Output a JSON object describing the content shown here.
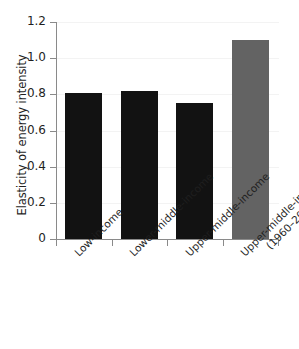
{
  "chart_data": {
    "type": "bar",
    "title": "",
    "xlabel": "",
    "ylabel": "Elasticity of energy intensity",
    "categories": [
      "Low-income",
      "Lower-middle-income",
      "Upper-middle-income",
      "Upper-middle-income\n(1960–2016)"
    ],
    "values": [
      0.81,
      0.82,
      0.75,
      1.1
    ],
    "bar_colors": [
      "#121212",
      "#121212",
      "#121212",
      "#636363"
    ],
    "ylim": [
      0,
      1.2
    ],
    "ytick_labels": [
      "1.2",
      "1.0",
      "0.8",
      "0.6",
      "0.4",
      "0.2",
      "0"
    ],
    "ytick_values": [
      1.2,
      1.0,
      0.8,
      0.6,
      0.4,
      0.2,
      0
    ],
    "grid": true,
    "grid_axis": "y",
    "legend": "none",
    "axis_color": "#8a8a8a",
    "text_color": "#1f1f1f",
    "background": "#ffffff"
  },
  "xticklabels": [
    {
      "line1": "Low-income",
      "line2": ""
    },
    {
      "line1": "Lower-middle-income",
      "line2": ""
    },
    {
      "line1": "Upper-middle-income",
      "line2": ""
    },
    {
      "line1": "Upper-middle-income",
      "line2": "(1960–2016)"
    }
  ]
}
